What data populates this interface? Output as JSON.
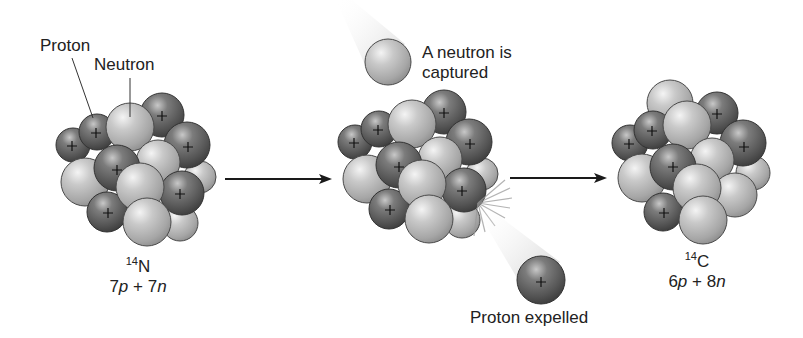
{
  "figure": {
    "colors": {
      "proton": "#5e5e5e",
      "neutron": "#b4b4b4",
      "outline": "#3a3a3a",
      "arrow": "#1a1a1a",
      "text": "#222222"
    }
  },
  "labels": {
    "proton": "Proton",
    "neutron": "Neutron",
    "capture_line1": "A neutron is",
    "capture_line2": "captured",
    "expelled": "Proton expelled"
  },
  "nuclei": [
    {
      "id": "nitrogen-14",
      "mass_number": "14",
      "symbol": "N",
      "protons": "7",
      "neutrons": "8",
      "formula": {
        "p": "7",
        "p_sym": "p",
        "plus": " + ",
        "n": "7",
        "n_sym": "n"
      }
    },
    {
      "id": "intermediate",
      "mass_number": "",
      "symbol": "",
      "formula": null
    },
    {
      "id": "carbon-14",
      "mass_number": "14",
      "symbol": "C",
      "formula": {
        "p": "6",
        "p_sym": "p",
        "plus": " + ",
        "n": "8",
        "n_sym": "n"
      }
    }
  ],
  "particles": {
    "incoming": {
      "type": "neutron",
      "cx": 388,
      "cy": 62,
      "r": 23
    },
    "expelled": {
      "type": "proton",
      "cx": 541,
      "cy": 280,
      "r": 24,
      "charge": "+"
    }
  },
  "arrows": [
    {
      "x1": 225,
      "x2": 332,
      "y": 179
    },
    {
      "x1": 510,
      "x2": 607,
      "y": 178
    }
  ]
}
